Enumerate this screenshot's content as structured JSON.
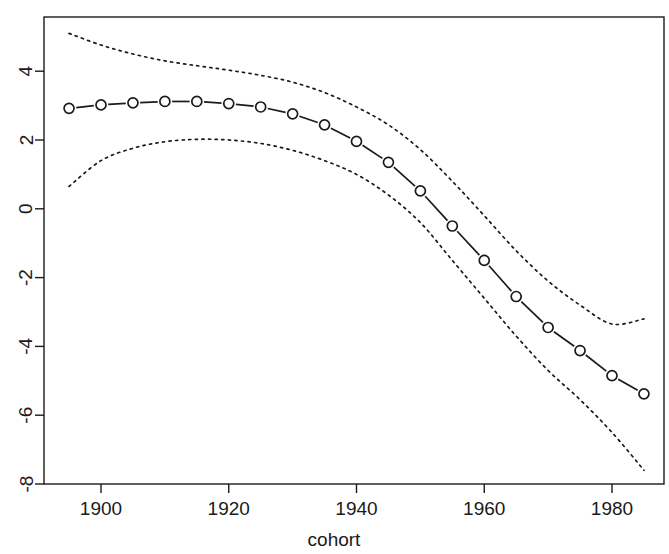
{
  "chart_data": {
    "type": "line",
    "title": "",
    "subtitle": "",
    "xlabel": "cohort",
    "ylabel": "",
    "xlim": [
      1893,
      1987
    ],
    "ylim": [
      -8.4,
      5.5
    ],
    "xticks": [
      1900,
      1920,
      1940,
      1960,
      1980
    ],
    "xticklabels": [
      "1900",
      "1920",
      "1940",
      "1960",
      "1980"
    ],
    "yticks": [
      4,
      2,
      0,
      -2,
      -4,
      -6,
      -8
    ],
    "yticklabels": [
      "4",
      "2",
      "0",
      "-2",
      "-4",
      "-6",
      "-8"
    ],
    "grid": false,
    "legend": null,
    "x": [
      1895,
      1900,
      1905,
      1910,
      1915,
      1920,
      1925,
      1930,
      1935,
      1940,
      1945,
      1950,
      1955,
      1960,
      1965,
      1970,
      1975,
      1980,
      1985
    ],
    "series": [
      {
        "name": "estimate",
        "style": "solid-line-with-open-circle-markers",
        "marker": "open-circle",
        "values": [
          2.92,
          3.02,
          3.08,
          3.12,
          3.12,
          3.06,
          2.96,
          2.76,
          2.44,
          1.96,
          1.35,
          0.52,
          -0.5,
          -1.5,
          -2.55,
          -3.45,
          -4.12,
          -4.85,
          -5.38
        ]
      },
      {
        "name": "upper confidence band",
        "style": "dotted-line",
        "marker": "none",
        "values": [
          5.1,
          4.76,
          4.5,
          4.3,
          4.16,
          4.03,
          3.88,
          3.68,
          3.38,
          2.96,
          2.44,
          1.72,
          0.8,
          -0.2,
          -1.22,
          -2.1,
          -2.8,
          -3.35,
          -3.2
        ]
      },
      {
        "name": "lower confidence band",
        "style": "dotted-line",
        "marker": "none",
        "values": [
          0.65,
          1.4,
          1.76,
          1.95,
          2.02,
          2.0,
          1.9,
          1.7,
          1.4,
          1.0,
          0.4,
          -0.4,
          -1.5,
          -2.6,
          -3.7,
          -4.7,
          -5.55,
          -6.5,
          -7.6
        ]
      }
    ],
    "colors": {
      "line": "#1a1a1a",
      "marker_fill": "#ffffff",
      "marker_stroke": "#1a1a1a",
      "band": "#1a1a1a",
      "axis": "#1a1a1a",
      "background": "#ffffff"
    }
  }
}
